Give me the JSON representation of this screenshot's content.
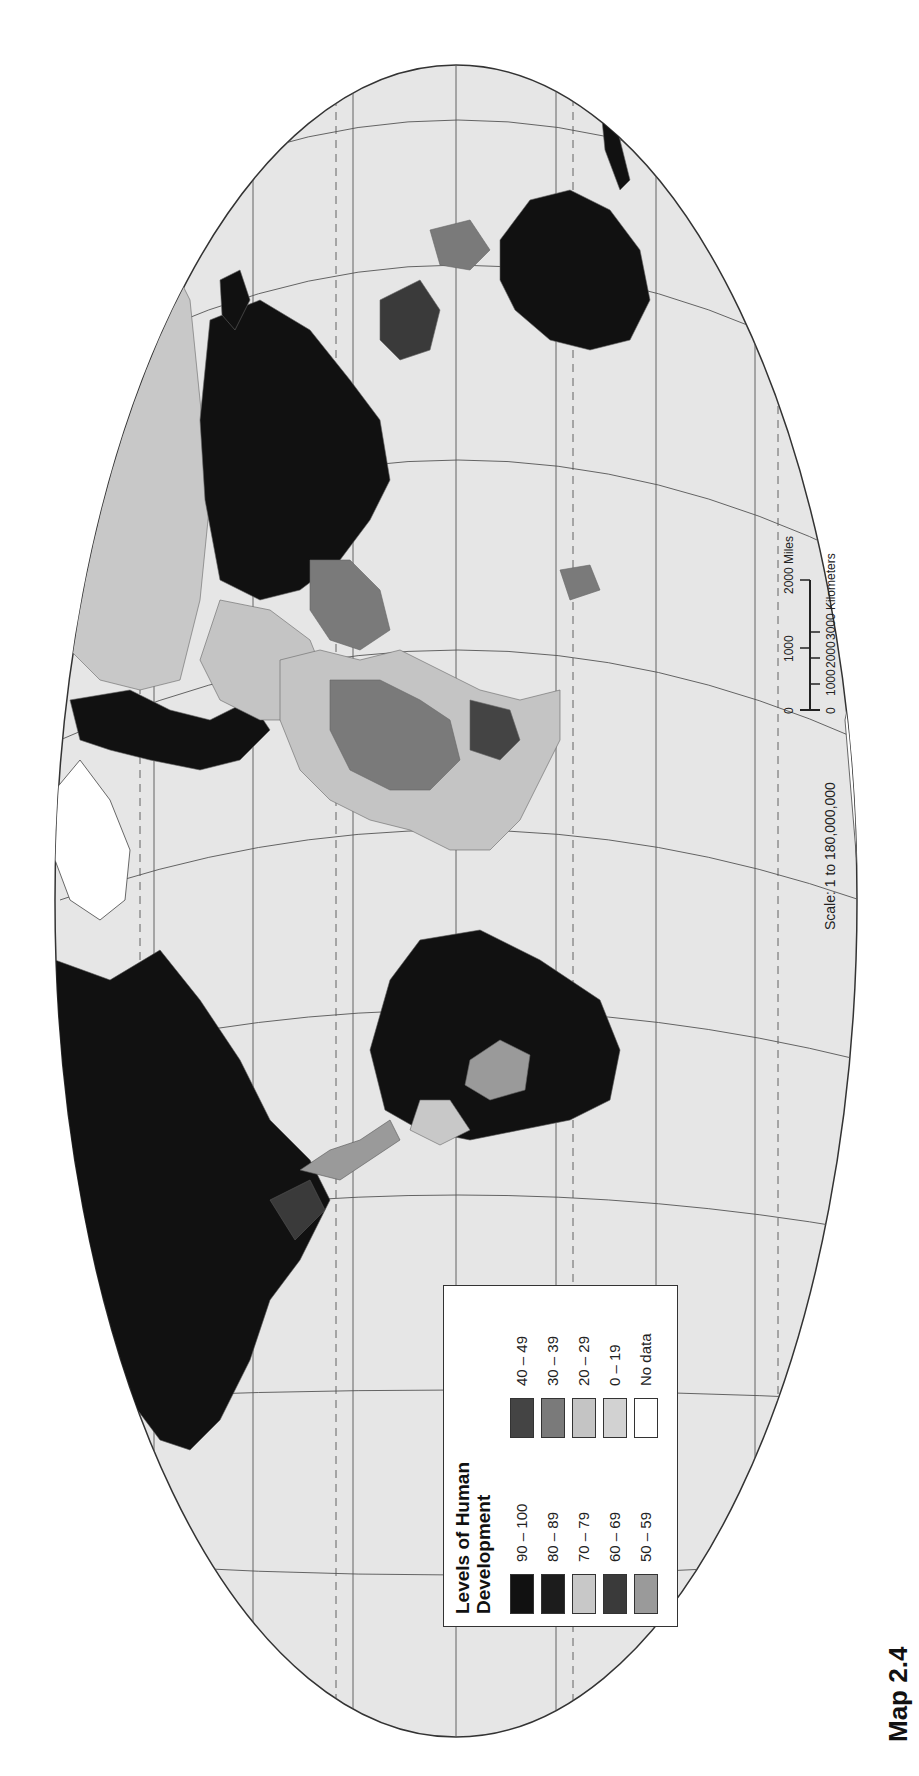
{
  "map": {
    "label": "Map 2.4",
    "projection_frame": "oval world map (rotated 90°)",
    "colors": {
      "ocean": "#e6e6e6",
      "border": "#444444",
      "graticule": "#555555"
    }
  },
  "legend": {
    "title_line1": "Levels of Human",
    "title_line2": "Development",
    "items": [
      {
        "label": "90 – 100",
        "color": "#111111"
      },
      {
        "label": "80 – 89",
        "color": "#1c1c1c"
      },
      {
        "label": "70 – 79",
        "color": "#c8c8c8"
      },
      {
        "label": "60 – 69",
        "color": "#3a3a3a"
      },
      {
        "label": "50 – 59",
        "color": "#9a9a9a"
      },
      {
        "label": "40 – 49",
        "color": "#444444"
      },
      {
        "label": "30 – 39",
        "color": "#7a7a7a"
      },
      {
        "label": "20 – 29",
        "color": "#c4c4c4"
      },
      {
        "label": "0 – 19",
        "color": "#d2d2d2"
      },
      {
        "label": "No data",
        "color": "#ffffff"
      }
    ]
  },
  "scale": {
    "text": "Scale: 1 to 180,000,000",
    "miles_ticks": [
      "0",
      "1000",
      "2000 Miles"
    ],
    "km_ticks": [
      "0",
      "1000",
      "2000",
      "3000 Kilometers"
    ]
  }
}
